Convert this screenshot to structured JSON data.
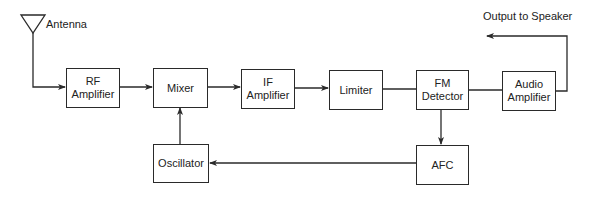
{
  "diagram": {
    "labels": {
      "antenna": "Antenna",
      "output": "Output to Speaker"
    },
    "blocks": {
      "rf_amplifier": "RF\nAmplifier",
      "mixer": "Mixer",
      "if_amplifier": "IF\nAmplifier",
      "limiter": "Limiter",
      "fm_detector": "FM\nDetector",
      "audio_amplifier": "Audio\nAmplifier",
      "oscillator": "Oscillator",
      "afc": "AFC"
    },
    "connections": [
      {
        "from": "Antenna",
        "to": "RF Amplifier"
      },
      {
        "from": "RF Amplifier",
        "to": "Mixer"
      },
      {
        "from": "Mixer",
        "to": "IF Amplifier"
      },
      {
        "from": "IF Amplifier",
        "to": "Limiter"
      },
      {
        "from": "Limiter",
        "to": "FM Detector"
      },
      {
        "from": "FM Detector",
        "to": "Audio Amplifier"
      },
      {
        "from": "Audio Amplifier",
        "to": "Output to Speaker"
      },
      {
        "from": "FM Detector",
        "to": "AFC"
      },
      {
        "from": "AFC",
        "to": "Oscillator"
      },
      {
        "from": "Oscillator",
        "to": "Mixer"
      }
    ],
    "colors": {
      "stroke": "#2a2a2a",
      "background": "#ffffff",
      "text": "#222222"
    }
  }
}
